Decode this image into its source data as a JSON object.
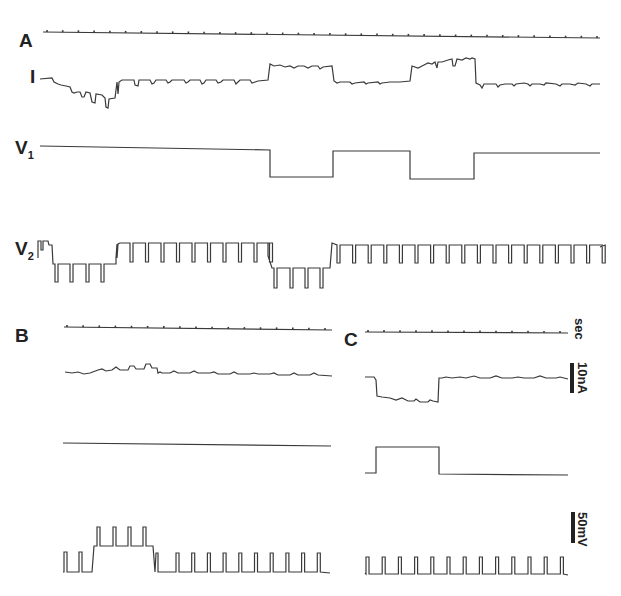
{
  "figure": {
    "panels": [
      {
        "id": "A",
        "label": "A",
        "traces": [
          "timebase",
          "I",
          "V1",
          "V2"
        ]
      },
      {
        "id": "B",
        "label": "B",
        "traces": [
          "timebase",
          "I",
          "V1",
          "V2"
        ]
      },
      {
        "id": "C",
        "label": "C",
        "traces": [
          "timebase",
          "I",
          "V1",
          "V2"
        ]
      }
    ],
    "trace_labels": {
      "current": "I",
      "v1_main": "V",
      "v1_sub": "1",
      "v2_main": "V",
      "v2_sub": "2"
    },
    "scale_bars": {
      "time": "sec",
      "current": "10nA",
      "voltage": "50mV"
    },
    "colors": {
      "trace": "#3a3a3a",
      "background": "#ffffff"
    }
  },
  "chart_data": {
    "type": "line",
    "title": "",
    "panels": [
      {
        "panel": "A",
        "timebase_ticks": 36,
        "series": [
          {
            "name": "I",
            "shape": "baseline with large inward deflection at start, two outward steps coinciding with V1 hyperpolarizations",
            "steps": [
              {
                "segment": "initial",
                "level": "baseline, dipping inward with transient notches"
              },
              {
                "segment": "V1 hyperpolarization 1",
                "level": "outward step"
              },
              {
                "segment": "between",
                "level": "baseline"
              },
              {
                "segment": "V1 hyperpolarization 2",
                "level": "outward step, rising"
              },
              {
                "segment": "end",
                "level": "baseline with notches"
              }
            ]
          },
          {
            "name": "V1",
            "shape": "square steps",
            "segments": [
              {
                "state": "high"
              },
              {
                "state": "low"
              },
              {
                "state": "high"
              },
              {
                "state": "low"
              },
              {
                "state": "high"
              }
            ]
          },
          {
            "name": "V2",
            "shape": "periodic spikes (downward pulses) with level shifts",
            "segments": [
              {
                "state": "high",
                "pulses": 1
              },
              {
                "state": "low",
                "pulses": 4
              },
              {
                "state": "high",
                "pulses": 10
              },
              {
                "state": "low",
                "pulses": 4
              },
              {
                "state": "high",
                "pulses": 18
              }
            ]
          }
        ]
      },
      {
        "panel": "B",
        "timebase_ticks": 17,
        "series": [
          {
            "name": "I",
            "shape": "baseline with small outward bumps"
          },
          {
            "name": "V1",
            "shape": "flat"
          },
          {
            "name": "V2",
            "shape": "upward spikes with depolarized plateau",
            "segments": [
              {
                "state": "low",
                "pulses": 2
              },
              {
                "state": "high",
                "pulses": 4
              },
              {
                "state": "low",
                "pulses": 11
              }
            ]
          }
        ]
      },
      {
        "panel": "C",
        "timebase_ticks": 13,
        "series": [
          {
            "name": "I",
            "shape": "inward step during V1 depolarization"
          },
          {
            "name": "V1",
            "shape": "single square depolarizing pulse",
            "segments": [
              {
                "state": "low"
              },
              {
                "state": "high"
              },
              {
                "state": "low"
              }
            ]
          },
          {
            "name": "V2",
            "shape": "regular upward spikes",
            "segments": [
              {
                "state": "low",
                "pulses": 13
              }
            ]
          }
        ]
      }
    ],
    "scale": {
      "time": "sec",
      "current": "10nA",
      "voltage": "50mV"
    }
  }
}
